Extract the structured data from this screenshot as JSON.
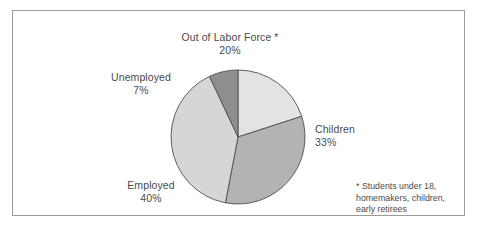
{
  "figure": {
    "border_color": "#9a9a9a",
    "background": "#ffffff"
  },
  "labels": {
    "out_of_labor_force": {
      "name": "Out of Labor Force *",
      "pct": "20%"
    },
    "unemployed": {
      "name": "Unemployed",
      "pct": "7%"
    },
    "children": {
      "name": "Children",
      "pct": "33%"
    },
    "employed": {
      "name": "Employed",
      "pct": "40%"
    }
  },
  "footnote": {
    "marker": "*",
    "line1": "Students under 18,",
    "line2": "homemakers, children,",
    "line3": "early retirees"
  },
  "chart_data": {
    "type": "pie",
    "title": "",
    "categories": [
      "Out of Labor Force *",
      "Children",
      "Employed",
      "Unemployed"
    ],
    "values": [
      20,
      33,
      40,
      7
    ],
    "value_labels": [
      "20%",
      "33%",
      "40%",
      "7%"
    ],
    "unit": "percent",
    "total": 100,
    "start_angle_deg": 0,
    "direction": "clockwise",
    "colors": [
      "#e3e3e3",
      "#b3b3b3",
      "#d6d6d6",
      "#8e8e8e"
    ],
    "slice_outline_color": "#4f4f4f",
    "legend": "none",
    "label_placement": "outside-callout",
    "annotations": [
      "* Students under 18, homemakers, children, early retirees"
    ]
  }
}
